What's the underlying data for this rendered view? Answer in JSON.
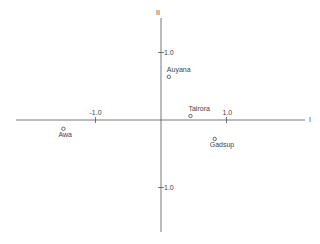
{
  "chart_data": {
    "type": "scatter",
    "title": "",
    "xlabel": "I",
    "ylabel": "II",
    "xlim": [
      -2.2,
      2.3
    ],
    "ylim": [
      -1.8,
      1.75
    ],
    "grid": false,
    "legend": null,
    "x_ticks": [
      {
        "value": -1.0,
        "label": "-1.0"
      },
      {
        "value": 1.0,
        "label": "1.0"
      }
    ],
    "y_ticks": [
      {
        "value": 1.0,
        "label": "1.0"
      },
      {
        "value": -1.0,
        "label": "-1.0"
      }
    ],
    "points": [
      {
        "name": "Auyana",
        "x": 0.12,
        "y": 0.64,
        "label_pos": "above"
      },
      {
        "name": "Tairora",
        "x": 0.45,
        "y": 0.06,
        "label_pos": "above"
      },
      {
        "name": "Gadsup",
        "x": 0.82,
        "y": -0.28,
        "label_pos": "below"
      },
      {
        "name": "Awa",
        "x": -1.49,
        "y": -0.13,
        "label_pos": "below"
      }
    ]
  },
  "axes": {
    "horizontal_name": "I",
    "vertical_name": "II"
  },
  "style": {
    "axis_color": "#555555",
    "marker_color": "#444444",
    "text_color": "#444444"
  }
}
